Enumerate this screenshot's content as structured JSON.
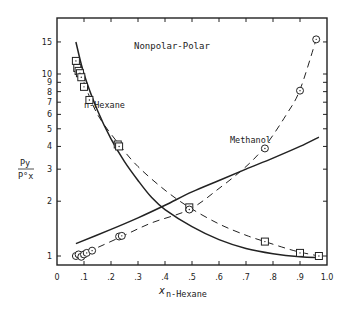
{
  "chart_data": {
    "type": "line",
    "title": "Nonpolar-Polar",
    "xlabel": "x n-Hexane",
    "xlabel_main": "x",
    "xlabel_sub": "n-Hexane",
    "ylabel_num": "Py",
    "ylabel_den": "P°x",
    "xlim": [
      0,
      1.0
    ],
    "ylim": [
      0.9,
      18
    ],
    "yscale": "log",
    "grid": false,
    "x_ticks": [
      0,
      0.1,
      0.2,
      0.3,
      0.4,
      0.5,
      0.6,
      0.7,
      0.8,
      0.9,
      1.0
    ],
    "x_tick_labels": [
      "0",
      ".1",
      ".2",
      ".3",
      ".4",
      ".5",
      ".6",
      ".7",
      ".8",
      ".9",
      "1.0"
    ],
    "y_ticks": [
      1,
      2,
      3,
      4,
      5,
      6,
      7,
      8,
      9,
      10,
      15
    ],
    "y_tick_labels": [
      "1",
      "2",
      "3",
      "4",
      "5",
      "6",
      "7",
      "8",
      "9",
      "10",
      "15"
    ],
    "annotations": [
      {
        "text": "n-Hexane",
        "x": 0.14,
        "y": 6.8
      },
      {
        "text": "Methanol",
        "x": 0.68,
        "y": 4.6
      },
      {
        "text": "Nonpolar-Polar",
        "x": 0.32,
        "y": 14.5
      }
    ],
    "series": [
      {
        "name": "n-Hexane (solid curve)",
        "style": "solid",
        "x": [
          0.07,
          0.1,
          0.15,
          0.2,
          0.25,
          0.3,
          0.35,
          0.4,
          0.5,
          0.6,
          0.7,
          0.8,
          0.9,
          0.97
        ],
        "y": [
          15,
          10,
          6.3,
          4.4,
          3.3,
          2.6,
          2.1,
          1.8,
          1.45,
          1.23,
          1.1,
          1.03,
          0.99,
          0.98
        ]
      },
      {
        "name": "n-Hexane (dashed curve)",
        "style": "dashed",
        "x": [
          0.07,
          0.1,
          0.15,
          0.23,
          0.3,
          0.4,
          0.49,
          0.6,
          0.7,
          0.77,
          0.85,
          0.9,
          0.97
        ],
        "y": [
          12,
          9,
          6,
          4.1,
          3.1,
          2.3,
          1.85,
          1.5,
          1.3,
          1.2,
          1.1,
          1.05,
          1.0
        ]
      },
      {
        "name": "n-Hexane data",
        "style": "markers-square",
        "x": [
          0.07,
          0.075,
          0.08,
          0.085,
          0.09,
          0.1,
          0.12,
          0.225,
          0.23,
          0.49,
          0.77,
          0.9,
          0.97
        ],
        "y": [
          11.8,
          10.8,
          10.4,
          10.1,
          9.6,
          8.5,
          7.2,
          4.1,
          4.0,
          1.85,
          1.2,
          1.04,
          1.0
        ]
      },
      {
        "name": "Methanol (solid curve)",
        "style": "solid",
        "x": [
          0.07,
          0.2,
          0.3,
          0.4,
          0.5,
          0.6,
          0.7,
          0.8,
          0.9,
          0.97
        ],
        "y": [
          1.17,
          1.4,
          1.62,
          1.9,
          2.25,
          2.6,
          3.0,
          3.45,
          4.0,
          4.5
        ]
      },
      {
        "name": "Methanol (dashed curve)",
        "style": "dashed",
        "x": [
          0.07,
          0.13,
          0.24,
          0.35,
          0.49,
          0.6,
          0.7,
          0.77,
          0.85,
          0.9,
          0.96
        ],
        "y": [
          1.0,
          1.08,
          1.28,
          1.52,
          1.8,
          2.35,
          3.1,
          4.0,
          6.0,
          8.2,
          15.5
        ]
      },
      {
        "name": "Methanol data",
        "style": "markers-circle",
        "x": [
          0.07,
          0.08,
          0.09,
          0.1,
          0.11,
          0.13,
          0.23,
          0.24,
          0.49,
          0.77,
          0.9,
          0.96
        ],
        "y": [
          1.0,
          1.02,
          0.99,
          1.02,
          1.04,
          1.07,
          1.28,
          1.29,
          1.8,
          3.9,
          8.1,
          15.5
        ]
      }
    ]
  }
}
